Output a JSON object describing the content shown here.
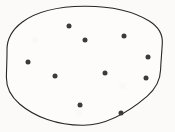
{
  "figure": {
    "type": "set-diagram",
    "title": "",
    "caption": "",
    "background_color": "#fbfaf8",
    "width": 175,
    "height": 132
  },
  "chart_data": {
    "type": "scatter",
    "title": "",
    "subtitle": "",
    "xlabel": "",
    "ylabel": "",
    "xlim": [
      0,
      175
    ],
    "ylim": [
      0,
      132
    ],
    "grid": false,
    "legend": "none",
    "annotations": [],
    "series": [
      {
        "name": "points",
        "marker": "filled-circle",
        "color": "#3b3b3b",
        "marker_size": 5,
        "values": [
          {
            "x": 69,
            "y": 26
          },
          {
            "x": 85,
            "y": 40
          },
          {
            "x": 124,
            "y": 36
          },
          {
            "x": 28,
            "y": 62
          },
          {
            "x": 55,
            "y": 76
          },
          {
            "x": 105,
            "y": 73
          },
          {
            "x": 146,
            "y": 78
          },
          {
            "x": 80,
            "y": 105
          },
          {
            "x": 121,
            "y": 113
          },
          {
            "x": 148,
            "y": 57
          }
        ]
      }
    ]
  },
  "boundary": {
    "shape_name": "ellipse",
    "stroke_color": "#262626",
    "fill_color": "#fdfcfa",
    "stroke_width": 1.1,
    "center_x": 84,
    "center_y": 65.5,
    "radius_x": 77,
    "radius_y": 59.5
  },
  "labels": {
    "inside_label": "",
    "outside_label": ""
  }
}
